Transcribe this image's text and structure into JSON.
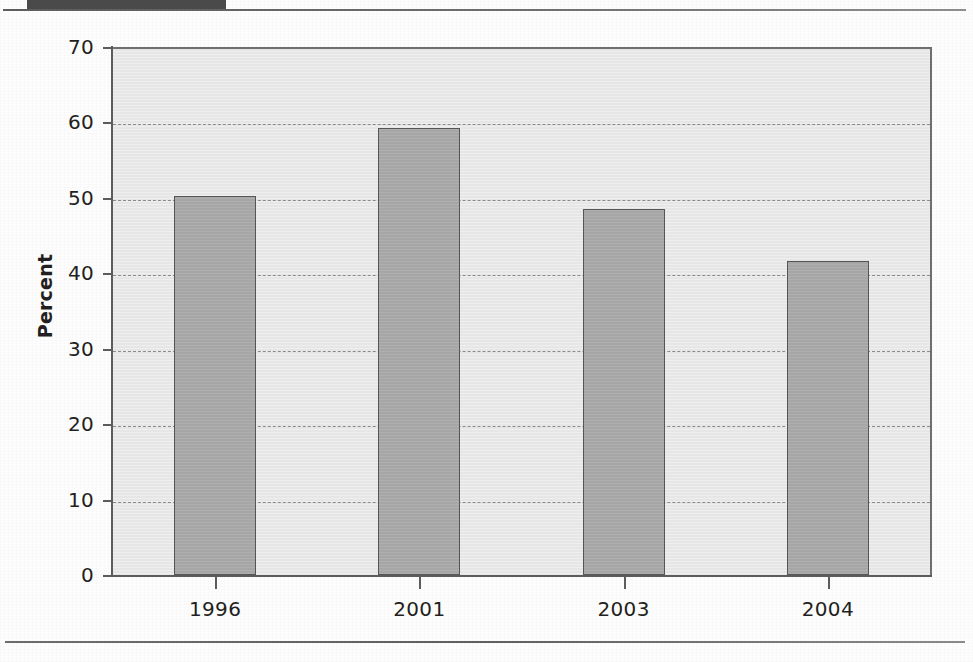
{
  "header": {
    "band_label": "",
    "ghost_title": ""
  },
  "chart_data": {
    "type": "bar",
    "title": "",
    "xlabel": "",
    "ylabel": "Percent",
    "categories": [
      "1996",
      "2001",
      "2003",
      "2004"
    ],
    "values": [
      50.2,
      59.2,
      48.5,
      41.6
    ],
    "ylim": [
      0,
      70
    ],
    "ytick_labels": [
      "0",
      "10",
      "20",
      "30",
      "40",
      "50",
      "60",
      "70"
    ],
    "ytick_values": [
      0,
      10,
      20,
      30,
      40,
      50,
      60,
      70
    ],
    "grid": true,
    "grid_style": "dashed",
    "legend": "none",
    "colors": {
      "bar_fill": "#a6a6a6",
      "bar_edge": "#555555",
      "plot_background": "#e6e6e6",
      "axis": "#5c5c5c",
      "grid": "#8a8a8a",
      "text": "#231f20",
      "header_band": "#4a4a4a"
    }
  }
}
